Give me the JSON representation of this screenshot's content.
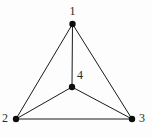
{
  "figure": {
    "kind": "undirected-graph-diagram",
    "width": 152,
    "height": 138,
    "background_color": "#fdfdfd",
    "edge_color": "#1a1a1a",
    "vertex_color": "#0d0d0d",
    "label_color": "#2b2b2b",
    "edge_width": 1,
    "vertex_radius": 3.2
  },
  "graph": {
    "vertices": [
      {
        "id": "1",
        "label": "1",
        "x": 72.5,
        "y": 24.0,
        "label_x": 69.5,
        "label_y": 5.0
      },
      {
        "id": "2",
        "label": "2",
        "x": 16.0,
        "y": 119.0,
        "label_x": 2.0,
        "label_y": 112.0
      },
      {
        "id": "3",
        "label": "3",
        "x": 132.0,
        "y": 119.0,
        "label_x": 139.0,
        "label_y": 112.0
      },
      {
        "id": "4",
        "label": "4",
        "x": 72.0,
        "y": 87.0,
        "label_x": 77.0,
        "label_y": 69.0
      }
    ],
    "edges": [
      {
        "from": "1",
        "to": "2"
      },
      {
        "from": "1",
        "to": "3"
      },
      {
        "from": "1",
        "to": "4"
      },
      {
        "from": "2",
        "to": "3"
      },
      {
        "from": "2",
        "to": "4"
      },
      {
        "from": "3",
        "to": "4"
      }
    ]
  }
}
